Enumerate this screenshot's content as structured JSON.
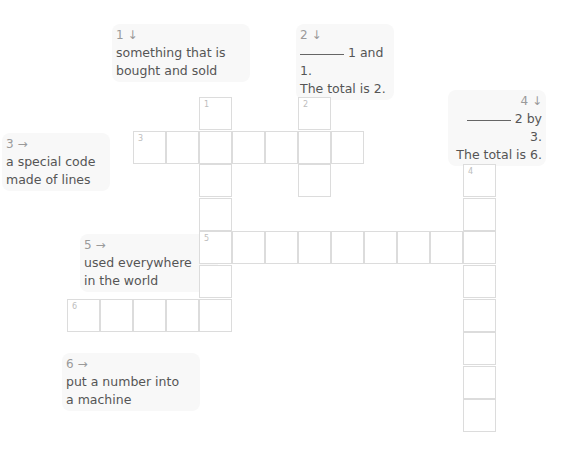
{
  "puzzle": {
    "clues": [
      {
        "id": "clue-1-down",
        "number": "1",
        "direction_icon": "down-arrow",
        "arrow": "↓",
        "blank": false,
        "lines": [
          "something that is",
          "bought and sold"
        ]
      },
      {
        "id": "clue-2-down",
        "number": "2",
        "direction_icon": "down-arrow",
        "arrow": "↓",
        "blank": true,
        "lines": [
          "1 and 1.",
          "The total is 2."
        ]
      },
      {
        "id": "clue-3-across",
        "number": "3",
        "direction_icon": "right-arrow",
        "arrow": "→",
        "blank": false,
        "lines": [
          "a special code",
          "made of lines"
        ]
      },
      {
        "id": "clue-4-down",
        "number": "4",
        "direction_icon": "down-arrow",
        "arrow": "↓",
        "blank": true,
        "lines": [
          "2 by 3.",
          "The total is 6."
        ]
      },
      {
        "id": "clue-5-across",
        "number": "5",
        "direction_icon": "right-arrow",
        "arrow": "→",
        "blank": false,
        "lines": [
          "used everywhere",
          "in the world"
        ]
      },
      {
        "id": "clue-6-across",
        "number": "6",
        "direction_icon": "right-arrow",
        "arrow": "→",
        "blank": false,
        "lines": [
          "put a number into",
          "a machine"
        ]
      }
    ],
    "words": [
      {
        "number": "1",
        "direction": "down",
        "row": 0,
        "col": 4,
        "length": 7
      },
      {
        "number": "2",
        "direction": "down",
        "row": 0,
        "col": 7,
        "length": 3
      },
      {
        "number": "3",
        "direction": "across",
        "row": 1,
        "col": 2,
        "length": 7
      },
      {
        "number": "4",
        "direction": "down",
        "row": 2,
        "col": 12,
        "length": 8
      },
      {
        "number": "5",
        "direction": "across",
        "row": 4,
        "col": 4,
        "length": 9
      },
      {
        "number": "6",
        "direction": "across",
        "row": 6,
        "col": 0,
        "length": 5
      }
    ],
    "colors": {
      "cell_border": "#dcdcdc",
      "clue_text": "#555555",
      "clue_number": "#9a9a9a",
      "clue_bg": "#f8f8f8"
    }
  }
}
